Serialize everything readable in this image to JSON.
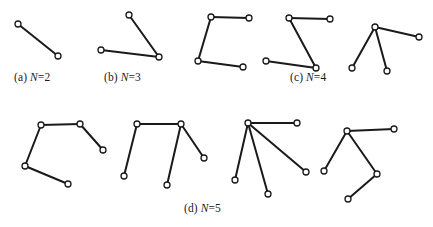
{
  "figure": {
    "type": "line-drawing-diagram",
    "background_color": "#ffffff",
    "stroke_color": "#1a1a1a",
    "node_fill_color": "#ffffff",
    "node_stroke_color": "#1a1a1a",
    "edge_width": 2.0,
    "node_radius": 3.0,
    "node_stroke_width": 1.3
  },
  "captions": [
    {
      "id": "cap-a",
      "prefix": "(a) ",
      "symbol": "N",
      "value": "=2",
      "text": "(a) N=2"
    },
    {
      "id": "cap-b",
      "prefix": "(b) ",
      "symbol": "N",
      "value": "=3",
      "text": "(b) N=3"
    },
    {
      "id": "cap-c",
      "prefix": "(c) ",
      "symbol": "N",
      "value": "=4",
      "text": "(c) N=4"
    },
    {
      "id": "cap-d",
      "prefix": "(d) ",
      "symbol": "N",
      "value": "=5",
      "text": "(d) N=5"
    }
  ],
  "graphs": [
    {
      "name": "graph-a-1",
      "group": "a",
      "node_count": 2,
      "nodes": [
        [
          18,
          24
        ],
        [
          58,
          56
        ]
      ],
      "edges": [
        [
          0,
          1
        ]
      ]
    },
    {
      "name": "graph-b-1",
      "group": "b",
      "node_count": 3,
      "nodes": [
        [
          129,
          15
        ],
        [
          159,
          57
        ],
        [
          101,
          50
        ]
      ],
      "edges": [
        [
          0,
          1
        ],
        [
          1,
          2
        ]
      ]
    },
    {
      "name": "graph-c-1",
      "group": "c",
      "node_count": 4,
      "nodes": [
        [
          249,
          18
        ],
        [
          211,
          17
        ],
        [
          198,
          61
        ],
        [
          243,
          67
        ]
      ],
      "edges": [
        [
          0,
          1
        ],
        [
          1,
          2
        ],
        [
          2,
          3
        ]
      ]
    },
    {
      "name": "graph-c-2",
      "group": "c",
      "node_count": 4,
      "nodes": [
        [
          330,
          19
        ],
        [
          289,
          18
        ],
        [
          316,
          68
        ],
        [
          266,
          61
        ]
      ],
      "edges": [
        [
          0,
          1
        ],
        [
          1,
          2
        ],
        [
          2,
          3
        ]
      ]
    },
    {
      "name": "graph-c-3",
      "group": "c",
      "node_count": 4,
      "nodes": [
        [
          375,
          27
        ],
        [
          419,
          37
        ],
        [
          352,
          68
        ],
        [
          387,
          71
        ]
      ],
      "edges": [
        [
          0,
          1
        ],
        [
          0,
          2
        ],
        [
          0,
          3
        ]
      ]
    },
    {
      "name": "graph-d-1",
      "group": "d",
      "node_count": 5,
      "nodes": [
        [
          103,
          150
        ],
        [
          80,
          124
        ],
        [
          41,
          125
        ],
        [
          25,
          166
        ],
        [
          68,
          184
        ]
      ],
      "edges": [
        [
          0,
          1
        ],
        [
          1,
          2
        ],
        [
          2,
          3
        ],
        [
          3,
          4
        ]
      ]
    },
    {
      "name": "graph-d-2",
      "group": "d",
      "node_count": 5,
      "nodes": [
        [
          124,
          176
        ],
        [
          137,
          124
        ],
        [
          181,
          124
        ],
        [
          167,
          185
        ],
        [
          204,
          158
        ]
      ],
      "edges": [
        [
          0,
          1
        ],
        [
          1,
          2
        ],
        [
          2,
          3
        ],
        [
          2,
          4
        ]
      ]
    },
    {
      "name": "graph-d-3",
      "group": "d",
      "node_count": 5,
      "nodes": [
        [
          248,
          123
        ],
        [
          297,
          123
        ],
        [
          306,
          172
        ],
        [
          268,
          194
        ],
        [
          235,
          180
        ]
      ],
      "edges": [
        [
          0,
          1
        ],
        [
          0,
          2
        ],
        [
          0,
          3
        ],
        [
          0,
          4
        ]
      ]
    },
    {
      "name": "graph-d-4",
      "group": "d",
      "node_count": 5,
      "nodes": [
        [
          347,
          131
        ],
        [
          394,
          129
        ],
        [
          324,
          171
        ],
        [
          377,
          174
        ],
        [
          348,
          199
        ]
      ],
      "edges": [
        [
          0,
          1
        ],
        [
          0,
          2
        ],
        [
          0,
          3
        ],
        [
          3,
          4
        ]
      ]
    }
  ]
}
